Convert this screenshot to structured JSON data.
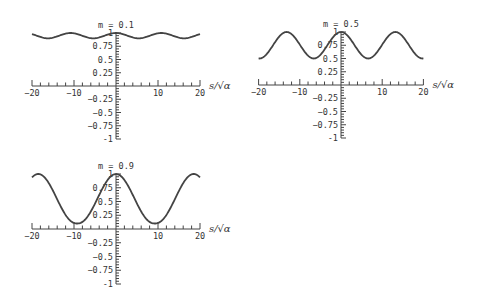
{
  "figure": {
    "xlabel": "s/√α"
  },
  "chart_data": [
    {
      "type": "line",
      "title": "m = 0.1",
      "xlabel": "s/√α",
      "ylabel": "",
      "xlim": [
        -20,
        20
      ],
      "ylim": [
        -1,
        1
      ],
      "x_ticks": [
        -20,
        -10,
        10,
        20
      ],
      "y_ticks": [
        -1,
        -0.75,
        -0.5,
        -0.25,
        0.25,
        0.5,
        0.75,
        1
      ],
      "series": [
        {
          "name": "m = 0.1",
          "min": 0.9,
          "max": 1.0,
          "period": 10.8,
          "peaks_at": [
            -10.8,
            0,
            10.8
          ]
        }
      ]
    },
    {
      "type": "line",
      "title": "m = 0.5",
      "xlabel": "s/√α",
      "ylabel": "",
      "xlim": [
        -20,
        20
      ],
      "ylim": [
        -1,
        1
      ],
      "x_ticks": [
        -20,
        -10,
        10,
        20
      ],
      "y_ticks": [
        -1,
        -0.75,
        -0.5,
        -0.25,
        0.25,
        0.5,
        0.75,
        1
      ],
      "series": [
        {
          "name": "m = 0.5",
          "min": 0.5,
          "max": 1.0,
          "period": 13.2,
          "peaks_at": [
            -13.2,
            0,
            13.2
          ]
        }
      ]
    },
    {
      "type": "line",
      "title": "m = 0.9",
      "xlabel": "s/√α",
      "ylabel": "",
      "xlim": [
        -20,
        20
      ],
      "ylim": [
        -1,
        1
      ],
      "x_ticks": [
        -20,
        -10,
        10,
        20
      ],
      "y_ticks": [
        -1,
        -0.75,
        -0.5,
        -0.25,
        0.25,
        0.5,
        0.75,
        1
      ],
      "series": [
        {
          "name": "m = 0.9",
          "min": 0.1,
          "max": 1.0,
          "period": 18.5,
          "peaks_at": [
            -18.5,
            0,
            18.5
          ]
        }
      ]
    }
  ],
  "panels": [
    {
      "title": "m = 0.1",
      "ox": 116,
      "oy": 86,
      "sx": 4.2,
      "sy": 53
    },
    {
      "title": "m = 0.5",
      "ox": 341,
      "oy": 85,
      "sx": 4.12,
      "sy": 53
    },
    {
      "title": "m = 0.9",
      "ox": 116,
      "oy": 229,
      "sx": 4.2,
      "sy": 55
    }
  ]
}
